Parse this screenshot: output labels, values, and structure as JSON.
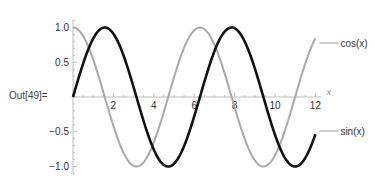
{
  "cell": {
    "out_label": "Out[49]="
  },
  "colors": {
    "sin": "#111111",
    "cos": "#a9a9a9",
    "axis": "#bdbdbd",
    "leader": "#9a9a9a"
  },
  "chart_data": {
    "type": "line",
    "title": "",
    "xlabel": "x",
    "ylabel": "",
    "xlim": [
      0,
      12
    ],
    "ylim": [
      -1.0,
      1.0
    ],
    "grid": false,
    "legend_position": "right (callout labels at curve ends)",
    "x_ticks": [
      2,
      4,
      6,
      8,
      10,
      12
    ],
    "x_tick_labels": [
      "2",
      "4",
      "6",
      "8",
      "10",
      "12"
    ],
    "y_ticks": [
      1.0,
      0.5,
      -0.5,
      -1.0
    ],
    "y_tick_labels": [
      "1.0",
      "0.5",
      "-0.5",
      "-1.0"
    ],
    "series": [
      {
        "name": "sin(x)",
        "function": "sin(x)",
        "color": "#111111",
        "x": [
          0,
          1,
          1.5708,
          2,
          3,
          3.1416,
          4,
          4.7124,
          5,
          6,
          7,
          7.854,
          8,
          9,
          9.4248,
          10,
          11,
          11,
          12
        ],
        "values": [
          0,
          0.841,
          1.0,
          0.909,
          0.141,
          0,
          -0.757,
          -1.0,
          -0.959,
          -0.279,
          0.657,
          1.0,
          0.989,
          0.412,
          0,
          -0.544,
          -1.0,
          -1.0,
          -0.537
        ]
      },
      {
        "name": "cos(x)",
        "function": "cos(x)",
        "color": "#a9a9a9",
        "x": [
          0,
          1,
          1.5708,
          2,
          3,
          3.1416,
          4,
          4.7124,
          5,
          6,
          6.2832,
          7,
          8,
          9,
          9.4248,
          10,
          11,
          12
        ],
        "values": [
          1.0,
          0.54,
          0,
          -0.416,
          -0.99,
          -1.0,
          -0.654,
          0,
          0.284,
          0.96,
          1.0,
          0.754,
          -0.146,
          -0.911,
          -1.0,
          -0.839,
          0.004,
          0.844
        ]
      }
    ],
    "legend": [
      {
        "label": "cos(x)",
        "series": "cos(x)"
      },
      {
        "label": "sin(x)",
        "series": "sin(x)"
      }
    ]
  }
}
